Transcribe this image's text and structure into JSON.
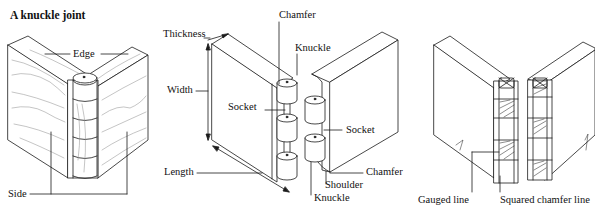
{
  "title": "A knuckle joint",
  "figures": [
    {
      "id": "assembled-joint",
      "labels": {
        "edge": "Edge",
        "side": "Side"
      }
    },
    {
      "id": "exploded-joint",
      "labels": {
        "thickness": "Thickness",
        "chamfer_top": "Chamfer",
        "knuckle_top": "Knuckle",
        "width": "Width",
        "socket_left": "Socket",
        "socket_right": "Socket",
        "length": "Length",
        "chamfer_bottom": "Chamfer",
        "shoulder": "Shoulder",
        "knuckle_bottom": "Knuckle"
      }
    },
    {
      "id": "marking-out",
      "labels": {
        "gauged_line": "Gauged line",
        "squared_chamfer_line": "Squared chamfer line"
      }
    }
  ],
  "colors": {
    "ink": "#1a1a1a",
    "paper": "#ffffff",
    "grain": "#8a8a8a"
  }
}
